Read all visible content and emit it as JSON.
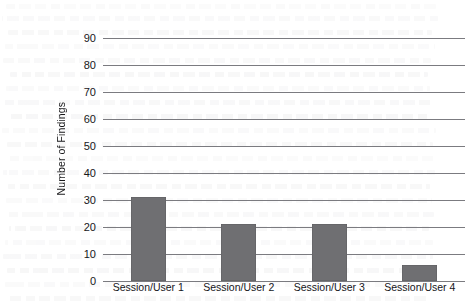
{
  "chart_data": {
    "type": "bar",
    "title": "",
    "subtitle": "",
    "xlabel": "",
    "ylabel": "Number of Findings",
    "categories": [
      "Session/User 1",
      "Session/User 2",
      "Session/User 3",
      "Session/User 4"
    ],
    "values": [
      31,
      21,
      21,
      6
    ],
    "series": [
      {
        "name": "Number of Findings",
        "values": [
          31,
          21,
          21,
          6
        ]
      }
    ],
    "ylim": [
      0,
      90
    ],
    "ytick_step": 10,
    "ytick_labels": [
      "0",
      "10",
      "20",
      "30",
      "40",
      "50",
      "60",
      "70",
      "80",
      "90"
    ],
    "ytick_values": [
      0,
      10,
      20,
      30,
      40,
      50,
      60,
      70,
      80,
      90
    ],
    "grid": true,
    "grid_axis": "y",
    "legend": false,
    "legend_position": "none",
    "bar_color": "#6f6f72",
    "gridline_color": "#7b7b80",
    "background_color": "#ffffff",
    "text_color": "#17171a",
    "annotations": []
  },
  "figure": {
    "name": "bar-chart-number-of-findings-per-session-user",
    "scan_artifact": "faint bleed-through text from reverse side of scanned page"
  }
}
